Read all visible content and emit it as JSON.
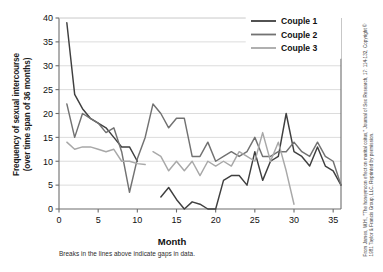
{
  "figure": {
    "caption": "Breaks in the lines above indicate gaps in data.",
    "credit_line1": "From James, W.H., \"The honeymoon effect on marital coitus,\" Journal of Sex Research,",
    "credit_line2": "17: 114-132, Copyright © 1981 Taylor & Francis Group, LLC. Reprinted by permission."
  },
  "colors": {
    "couple1": "#3f3f3f",
    "couple2": "#727272",
    "couple3": "#a8a8a8",
    "grid": "#d8d8d8",
    "axis": "#6d6d6d",
    "text": "#111111"
  },
  "chart_data": {
    "type": "line",
    "title": "",
    "xlabel": "Month",
    "ylabel": "Frequency of sexual intercourse (over time span of 36 months)",
    "ylabel_line1": "Frequency of sexual intercourse",
    "ylabel_line2": "(over time span of 36 months)",
    "xlim": [
      0,
      36
    ],
    "ylim": [
      0,
      40
    ],
    "xticks": [
      0,
      5,
      10,
      15,
      20,
      25,
      30,
      35
    ],
    "yticks": [
      0,
      5,
      10,
      15,
      20,
      25,
      30,
      35,
      40
    ],
    "grid": "horizontal",
    "legend_position": "top-right",
    "series": [
      {
        "name": "Couple 1",
        "color": "#3f3f3f",
        "segments": [
          {
            "x": [
              1,
              2,
              3,
              4,
              5,
              6,
              7,
              8,
              9,
              10
            ],
            "y": [
              39,
              24,
              21,
              19,
              18,
              17,
              15,
              13,
              13,
              10
            ]
          },
          {
            "x": [
              13,
              14,
              15,
              16,
              17,
              18,
              19,
              20,
              21,
              22,
              23,
              24,
              25,
              26,
              27,
              28,
              29,
              30,
              31,
              32,
              33,
              34,
              35,
              36
            ],
            "y": [
              2.5,
              4.5,
              2,
              0,
              1.5,
              1,
              0,
              0,
              6,
              7,
              7,
              5,
              12,
              6,
              10,
              11,
              20,
              12,
              11,
              9,
              13,
              9,
              8,
              5
            ]
          }
        ]
      },
      {
        "name": "Couple 2",
        "color": "#727272",
        "segments": [
          {
            "x": [
              1,
              2,
              3,
              4,
              5,
              6,
              7,
              8,
              9,
              10,
              11,
              12,
              13,
              14,
              15,
              16,
              17,
              18,
              19,
              20,
              21,
              22,
              23,
              24,
              25,
              26,
              27,
              28,
              29,
              30,
              31,
              32,
              33,
              34,
              35,
              36
            ],
            "y": [
              22,
              15,
              20,
              19,
              18,
              16,
              17,
              12,
              3.5,
              10.5,
              15,
              22,
              20,
              17,
              19,
              19,
              11,
              11,
              14,
              10,
              11,
              12,
              11,
              12,
              15,
              11,
              11,
              12,
              12,
              14,
              12,
              11,
              14,
              11,
              10,
              5
            ]
          }
        ]
      },
      {
        "name": "Couple 3",
        "color": "#a8a8a8",
        "segments": [
          {
            "x": [
              1,
              2,
              3,
              4,
              5,
              6,
              7,
              8,
              9,
              10,
              11
            ],
            "y": [
              14,
              12.5,
              13,
              13,
              12.5,
              12,
              12.5,
              10,
              10,
              9.5,
              9.3
            ]
          },
          {
            "x": [
              12,
              13,
              14,
              15,
              16,
              17,
              18,
              19,
              20,
              21,
              22,
              23,
              24,
              25,
              26,
              27,
              28,
              29,
              30
            ],
            "y": [
              12,
              11,
              8,
              10,
              8,
              10,
              7,
              10,
              9,
              10,
              9,
              12,
              11,
              10,
              16,
              10,
              14,
              8,
              1
            ]
          }
        ]
      }
    ]
  },
  "legend": {
    "items": [
      {
        "label": "Couple 1"
      },
      {
        "label": "Couple 2"
      },
      {
        "label": "Couple 3"
      }
    ]
  }
}
